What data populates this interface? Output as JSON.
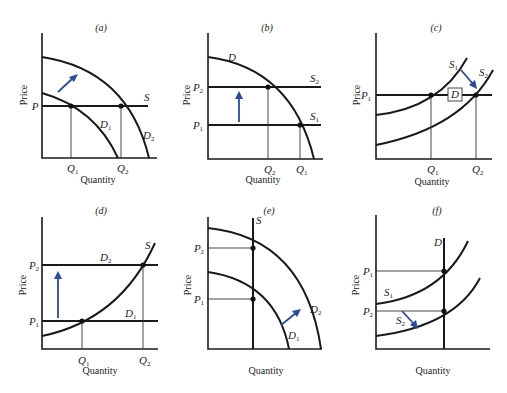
{
  "figure": {
    "panels": [
      {
        "id": "a",
        "title": "(a)",
        "ylabel": "Price",
        "xlabel": "Quantity",
        "price_labels": [
          "P"
        ],
        "quantity_labels": [
          "Q1",
          "Q2"
        ],
        "curve_labels": [
          "S",
          "D1",
          "D2"
        ],
        "shift": "demand outward (D1 → D2)"
      },
      {
        "id": "b",
        "title": "(b)",
        "ylabel": "Price",
        "xlabel": "Quantity",
        "price_labels": [
          "P2",
          "P1"
        ],
        "quantity_labels": [
          "Q2",
          "Q1"
        ],
        "curve_labels": [
          "D",
          "S2",
          "S1"
        ],
        "shift": "supply up (S1 → S2)"
      },
      {
        "id": "c",
        "title": "(c)",
        "ylabel": "Price",
        "xlabel": "Quantity",
        "price_labels": [
          "P1"
        ],
        "quantity_labels": [
          "Q1",
          "Q2"
        ],
        "curve_labels": [
          "S1",
          "S2",
          "D"
        ],
        "shift": "supply outward (S1 → S2)"
      },
      {
        "id": "d",
        "title": "(d)",
        "ylabel": "Price",
        "xlabel": "Quantity",
        "price_labels": [
          "P2",
          "P1"
        ],
        "quantity_labels": [
          "Q1",
          "Q2"
        ],
        "curve_labels": [
          "S",
          "D2",
          "D1"
        ],
        "shift": "demand up (D1 → D2)"
      },
      {
        "id": "e",
        "title": "(e)",
        "ylabel": "Price",
        "xlabel": "Quantity",
        "price_labels": [
          "P2",
          "P1"
        ],
        "quantity_labels": [],
        "curve_labels": [
          "S",
          "D2",
          "D1"
        ],
        "shift": "demand outward (D1 → D2)"
      },
      {
        "id": "f",
        "title": "(f)",
        "ylabel": "Price",
        "xlabel": "Quantity",
        "price_labels": [
          "P1",
          "P2"
        ],
        "quantity_labels": [],
        "curve_labels": [
          "D",
          "S1",
          "S2"
        ],
        "shift": "supply down (S1 → S2)"
      }
    ],
    "text": {
      "price": "Price",
      "quantity": "Quantity",
      "P": "P",
      "Q": "Q",
      "S": "S",
      "D": "D",
      "sub1": "1",
      "sub2": "2",
      "ta": "(a)",
      "tb": "(b)",
      "tc": "(c)",
      "td": "(d)",
      "te": "(e)",
      "tf": "(f)"
    },
    "colors": {
      "curve": "#1a1a1a",
      "arrow": "#2a4a9a",
      "background": "#ffffff"
    }
  }
}
